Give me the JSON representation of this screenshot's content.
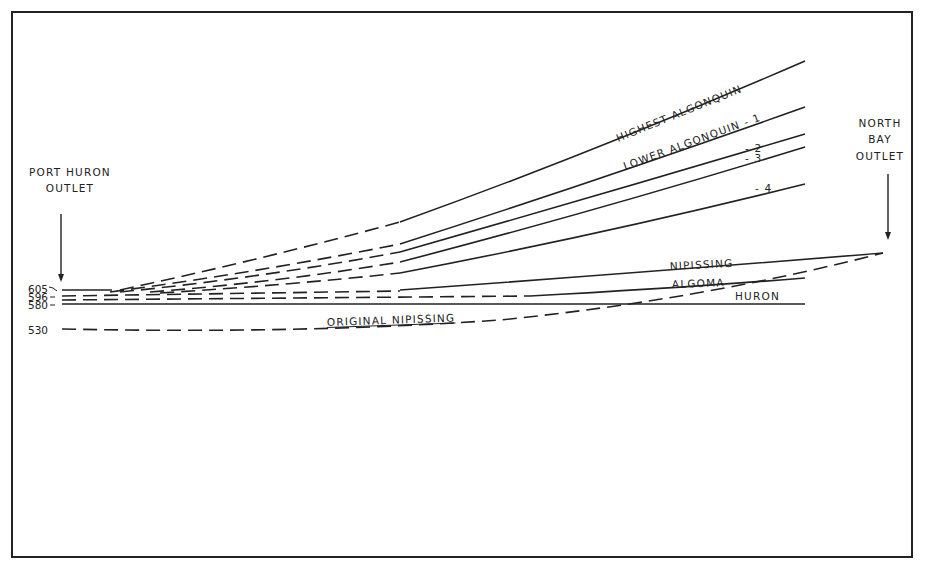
{
  "diagram": {
    "type": "shoreline-profile",
    "frame": {
      "x": 12,
      "y": 12,
      "width": 900,
      "height": 545,
      "stroke": "#222222"
    },
    "left_outlet": {
      "lines": [
        "PORT HURON",
        "OUTLET"
      ],
      "arrow": "down-arrow"
    },
    "right_outlet": {
      "lines": [
        "NORTH",
        "BAY",
        "OUTLET"
      ],
      "arrow": "down-arrow"
    },
    "elevations": [
      {
        "label": "605",
        "y": 290
      },
      {
        "label": "596",
        "y": 297
      },
      {
        "label": "580",
        "y": 304
      },
      {
        "label": "530",
        "y": 330
      }
    ],
    "shorelines": [
      {
        "name": "HIGHEST ALGONQUIN",
        "style": "dashed-then-solid"
      },
      {
        "name": "LOWER ALGONQUIN - 1",
        "style": "dashed-then-solid"
      },
      {
        "name": "- 2",
        "style": "dashed-then-solid"
      },
      {
        "name": "- 3",
        "style": "dashed-then-solid"
      },
      {
        "name": "- 4",
        "style": "dashed-then-solid"
      },
      {
        "name": "NIPISSING",
        "style": "dashed-then-solid"
      },
      {
        "name": "ALGOMA",
        "style": "dashed-then-solid"
      },
      {
        "name": "HURON",
        "style": "solid"
      },
      {
        "name": "ORIGINAL NIPISSING",
        "style": "dashed"
      }
    ]
  }
}
